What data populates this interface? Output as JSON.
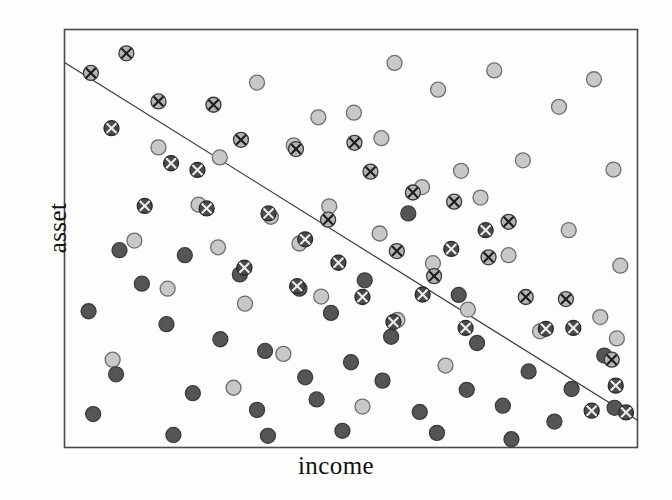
{
  "chart_data": {
    "type": "scatter",
    "title": "",
    "subtitle": "",
    "xlabel": "income",
    "ylabel": "asset",
    "xlim": [
      0,
      100
    ],
    "ylim": [
      0,
      100
    ],
    "grid": false,
    "legend_position": "none",
    "annotations": [
      {
        "type": "line",
        "name": "decision-boundary",
        "x": [
          0,
          100
        ],
        "y": [
          92.1,
          6.5
        ],
        "color": "#3a3a3a",
        "width": 1.2
      }
    ],
    "marker_styles": {
      "light": {
        "name": "light-circle",
        "fill": "#c8c8c8",
        "stroke": "#6e6e6e",
        "cross": false,
        "radius": 7.5
      },
      "dark": {
        "name": "dark-circle",
        "fill": "#555555",
        "stroke": "#3c3c3c",
        "cross": false,
        "radius": 7.5
      },
      "light_x": {
        "name": "light-circle-cross",
        "fill": "#b4b4b4",
        "stroke": "#3a3a3a",
        "cross": true,
        "cross_color": "#1c1c1c",
        "radius": 7.5
      },
      "dark_x": {
        "name": "dark-circle-cross",
        "fill": "#4a4a4a",
        "stroke": "#2a2a2a",
        "cross": true,
        "cross_color": "#ededed",
        "radius": 7.5
      }
    },
    "series": [
      {
        "name": "light",
        "style": "light",
        "points": [
          [
            33.6,
            87.3
          ],
          [
            57.6,
            92.0
          ],
          [
            75.0,
            90.2
          ],
          [
            92.4,
            88.1
          ],
          [
            44.3,
            79.0
          ],
          [
            65.2,
            85.6
          ],
          [
            86.3,
            81.5
          ],
          [
            16.4,
            71.8
          ],
          [
            27.1,
            69.4
          ],
          [
            40.0,
            72.3
          ],
          [
            55.3,
            74.0
          ],
          [
            69.2,
            66.2
          ],
          [
            80.0,
            68.7
          ],
          [
            95.8,
            66.5
          ],
          [
            50.5,
            80.1
          ],
          [
            62.4,
            62.3
          ],
          [
            72.6,
            59.8
          ],
          [
            23.4,
            58.1
          ],
          [
            36.0,
            55.2
          ],
          [
            46.2,
            57.7
          ],
          [
            12.2,
            49.5
          ],
          [
            26.8,
            47.9
          ],
          [
            41.0,
            48.8
          ],
          [
            55.0,
            51.2
          ],
          [
            64.3,
            44.1
          ],
          [
            77.5,
            46.0
          ],
          [
            88.0,
            52.0
          ],
          [
            97.0,
            43.5
          ],
          [
            18.0,
            38.0
          ],
          [
            31.5,
            34.4
          ],
          [
            44.8,
            36.1
          ],
          [
            58.1,
            30.5
          ],
          [
            70.4,
            33.0
          ],
          [
            83.0,
            27.8
          ],
          [
            93.5,
            31.2
          ],
          [
            96.4,
            26.1
          ],
          [
            8.4,
            21.0
          ],
          [
            38.2,
            22.4
          ],
          [
            66.5,
            19.6
          ],
          [
            29.5,
            14.3
          ],
          [
            52.0,
            9.8
          ]
        ]
      },
      {
        "name": "dark",
        "style": "dark",
        "points": [
          [
            60.0,
            56.0
          ],
          [
            9.6,
            47.2
          ],
          [
            21.0,
            46.0
          ],
          [
            13.5,
            39.2
          ],
          [
            30.6,
            41.4
          ],
          [
            41.0,
            38.0
          ],
          [
            4.2,
            32.6
          ],
          [
            17.8,
            29.5
          ],
          [
            27.2,
            25.9
          ],
          [
            35.0,
            23.1
          ],
          [
            46.5,
            32.2
          ],
          [
            50.0,
            20.4
          ],
          [
            9.0,
            17.5
          ],
          [
            22.4,
            13.0
          ],
          [
            33.6,
            9.0
          ],
          [
            44.0,
            11.5
          ],
          [
            55.5,
            16.0
          ],
          [
            62.0,
            8.5
          ],
          [
            70.2,
            13.8
          ],
          [
            76.5,
            10.0
          ],
          [
            81.0,
            18.2
          ],
          [
            85.5,
            6.2
          ],
          [
            88.5,
            14.0
          ],
          [
            94.2,
            22.0
          ],
          [
            72.0,
            25.0
          ],
          [
            65.0,
            3.5
          ],
          [
            48.5,
            4.0
          ],
          [
            35.5,
            2.8
          ],
          [
            19.0,
            3.0
          ],
          [
            78.0,
            2.0
          ],
          [
            96.0,
            9.5
          ],
          [
            57.0,
            26.5
          ],
          [
            68.8,
            36.5
          ],
          [
            52.4,
            40.0
          ],
          [
            5.0,
            8.0
          ],
          [
            42.0,
            16.8
          ]
        ]
      },
      {
        "name": "light_x",
        "style": "light_x",
        "points": [
          [
            4.6,
            89.6
          ],
          [
            10.8,
            94.3
          ],
          [
            16.4,
            82.8
          ],
          [
            26.0,
            82.0
          ],
          [
            30.8,
            73.6
          ],
          [
            40.4,
            71.4
          ],
          [
            50.6,
            72.9
          ],
          [
            53.4,
            66.0
          ],
          [
            60.8,
            61.0
          ],
          [
            68.0,
            58.8
          ],
          [
            77.5,
            54.0
          ],
          [
            58.0,
            47.0
          ],
          [
            64.5,
            41.0
          ],
          [
            80.5,
            36.0
          ],
          [
            87.5,
            35.5
          ],
          [
            95.5,
            21.0
          ],
          [
            46.0,
            54.5
          ],
          [
            74.0,
            45.5
          ]
        ]
      },
      {
        "name": "dark_x",
        "style": "dark_x",
        "points": [
          [
            8.2,
            76.4
          ],
          [
            18.6,
            68.0
          ],
          [
            23.2,
            66.4
          ],
          [
            14.0,
            57.8
          ],
          [
            24.8,
            57.2
          ],
          [
            35.6,
            56.0
          ],
          [
            42.0,
            49.8
          ],
          [
            31.4,
            43.0
          ],
          [
            40.6,
            38.6
          ],
          [
            47.8,
            44.2
          ],
          [
            52.0,
            36.0
          ],
          [
            62.5,
            36.6
          ],
          [
            57.4,
            30.0
          ],
          [
            70.0,
            28.6
          ],
          [
            84.0,
            28.4
          ],
          [
            88.8,
            28.6
          ],
          [
            96.2,
            14.8
          ],
          [
            98.0,
            8.4
          ],
          [
            92.0,
            8.8
          ],
          [
            67.5,
            47.5
          ],
          [
            73.5,
            52.0
          ]
        ]
      }
    ]
  },
  "axes": {
    "x_title": "income",
    "y_title": "asset"
  }
}
